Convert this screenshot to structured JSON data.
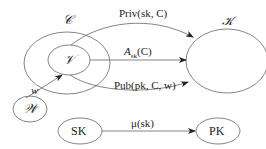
{
  "diagram": {
    "nodes": [
      {
        "id": "C",
        "label": "𝒞",
        "kind": "outer-set"
      },
      {
        "id": "V",
        "label": "𝒱",
        "kind": "inner-set"
      },
      {
        "id": "K",
        "label": "𝒦",
        "kind": "set"
      },
      {
        "id": "W",
        "label": "𝒲",
        "kind": "set"
      },
      {
        "id": "SK",
        "label": "SK",
        "kind": "node"
      },
      {
        "id": "PK",
        "label": "PK",
        "kind": "node"
      }
    ],
    "edges": [
      {
        "from": "V",
        "to": "K",
        "label": "Priv(sk, C)"
      },
      {
        "from": "V",
        "to": "K",
        "label": "A_sk(C)",
        "label_main": "A",
        "label_sub": "sk",
        "label_tail": "(C)"
      },
      {
        "from": "V",
        "to": "K",
        "label": "Pub(pk, C, w)"
      },
      {
        "from": "W",
        "to": "V",
        "label": "w"
      },
      {
        "from": "SK",
        "to": "PK",
        "label": "μ(sk)"
      }
    ]
  },
  "labels": {
    "C": "𝒞",
    "V": "𝒱",
    "K": "𝒦",
    "W": "𝒲",
    "SK": "SK",
    "PK": "PK",
    "priv": "Priv(sk, C)",
    "a_main": "A",
    "a_sub": "sk",
    "a_tail": "(C)",
    "pub": "Pub(pk, C, w)",
    "w": "w",
    "mu": "μ(sk)"
  },
  "colors": {
    "stroke": "#555555",
    "text": "#222222",
    "background": "#ffffff"
  }
}
